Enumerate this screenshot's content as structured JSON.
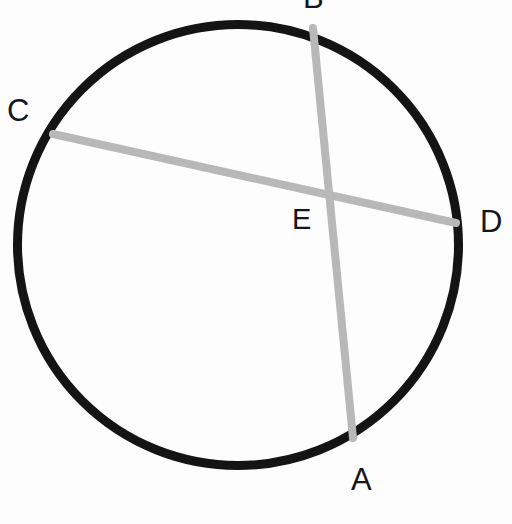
{
  "figure": {
    "kind": "circle-with-two-intersecting-chords",
    "background_color": "#fdfdfd",
    "circle": {
      "stroke_color": "#141414",
      "stroke_width": 9,
      "center_x": 238,
      "center_y": 245,
      "radius": 225
    },
    "chords": [
      {
        "name": "chord-AB",
        "from_label": "B",
        "to_label": "A",
        "stroke_color": "#b8b8b8",
        "stroke_width": 8,
        "x1": 313,
        "y1": 28,
        "x2": 353,
        "y2": 438
      },
      {
        "name": "chord-CD",
        "from_label": "C",
        "to_label": "D",
        "stroke_color": "#b8b8b8",
        "stroke_width": 8,
        "x1": 53,
        "y1": 134,
        "x2": 456,
        "y2": 223
      }
    ],
    "intersection": {
      "name": "E",
      "x": 325,
      "y": 192
    }
  },
  "labels": {
    "A": "A",
    "B": "B",
    "C": "C",
    "D": "D",
    "E": "E"
  },
  "chart_data": {
    "type": "scatter",
    "title": "",
    "xlabel": "",
    "ylabel": "",
    "xlim": [
      0,
      512
    ],
    "ylim": [
      0,
      524
    ],
    "grid": false,
    "legend": null,
    "annotations": [
      "Chord AB and chord CD intersect at interior point E",
      "Label B is clipped by the top edge of the image"
    ],
    "points": [
      {
        "label": "A",
        "x": 353,
        "y": 438,
        "on": "circle"
      },
      {
        "label": "B",
        "x": 313,
        "y": 28,
        "on": "circle"
      },
      {
        "label": "C",
        "x": 53,
        "y": 134,
        "on": "circle"
      },
      {
        "label": "D",
        "x": 456,
        "y": 223,
        "on": "circle"
      },
      {
        "label": "E",
        "x": 325,
        "y": 192,
        "on": "chord-intersection"
      }
    ],
    "segments": [
      {
        "name": "AB",
        "endpoints": [
          "B",
          "A"
        ],
        "color": "#b8b8b8"
      },
      {
        "name": "CD",
        "endpoints": [
          "C",
          "D"
        ],
        "color": "#b8b8b8"
      }
    ]
  }
}
